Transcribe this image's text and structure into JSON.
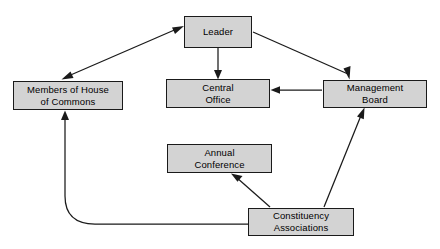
{
  "diagram": {
    "style": {
      "node_fill": "#d3d3d3",
      "node_border": "#1a1a1a",
      "edge_color": "#1a1a1a",
      "background": "#ffffff"
    },
    "nodes": [
      {
        "id": "leader",
        "lines": [
          "Leader"
        ],
        "line1": "Leader",
        "line2": "",
        "x": 184,
        "y": 16,
        "w": 68,
        "h": 32
      },
      {
        "id": "members-of-house-of-commons",
        "lines": [
          "Members of House",
          "of Commons"
        ],
        "line1": "Members of House",
        "line2": "of Commons",
        "x": 13,
        "y": 81,
        "w": 110,
        "h": 29
      },
      {
        "id": "central-office",
        "lines": [
          "Central",
          "Office"
        ],
        "line1": "Central",
        "line2": "Office",
        "x": 166,
        "y": 79,
        "w": 104,
        "h": 29
      },
      {
        "id": "management-board",
        "lines": [
          "Management",
          "Board"
        ],
        "line1": "Management",
        "line2": "Board",
        "x": 323,
        "y": 80,
        "w": 104,
        "h": 28
      },
      {
        "id": "annual-conference",
        "lines": [
          "Annual",
          "Conference"
        ],
        "line1": "Annual",
        "line2": "Conference",
        "x": 167,
        "y": 144,
        "w": 105,
        "h": 29
      },
      {
        "id": "constituency-associations",
        "lines": [
          "Constituency",
          "Associations"
        ],
        "line1": "Constituency",
        "line2": "Associations",
        "x": 248,
        "y": 208,
        "w": 106,
        "h": 28
      }
    ],
    "edges": [
      {
        "id": "members-leader",
        "from": "members-of-house-of-commons",
        "to": "leader",
        "direction": "bidirectional",
        "shape": "straight"
      },
      {
        "id": "leader-management-board",
        "from": "leader",
        "to": "management-board",
        "direction": "forward",
        "shape": "straight"
      },
      {
        "id": "leader-central-office",
        "from": "leader",
        "to": "central-office",
        "direction": "forward",
        "shape": "straight"
      },
      {
        "id": "management-board-central-office",
        "from": "management-board",
        "to": "central-office",
        "direction": "forward",
        "shape": "straight"
      },
      {
        "id": "constituency-associations-management-board",
        "from": "constituency-associations",
        "to": "management-board",
        "direction": "forward",
        "shape": "straight"
      },
      {
        "id": "constituency-associations-annual-conference",
        "from": "constituency-associations",
        "to": "annual-conference",
        "direction": "forward",
        "shape": "straight"
      },
      {
        "id": "constituency-associations-members",
        "from": "constituency-associations",
        "to": "members-of-house-of-commons",
        "direction": "forward",
        "shape": "curved"
      }
    ]
  }
}
